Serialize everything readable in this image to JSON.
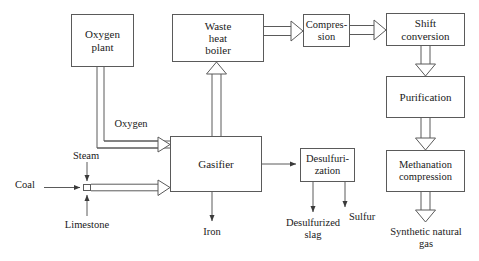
{
  "diagram": {
    "type": "process-flow-diagram",
    "colors": {
      "stroke": "#5a5a5a",
      "text": "#1a1a1a",
      "background": "#ffffff"
    },
    "nodes": [
      {
        "id": "oxygen-plant",
        "label": "Oxygen\nplant",
        "x": 71,
        "y": 14,
        "w": 63,
        "h": 53
      },
      {
        "id": "waste-heat-boiler",
        "label": "Waste\nheat\nboiler",
        "x": 172,
        "y": 14,
        "w": 92,
        "h": 48
      },
      {
        "id": "compression",
        "label": "Compres-\nsion",
        "x": 303,
        "y": 14,
        "w": 47,
        "h": 33
      },
      {
        "id": "shift-conversion",
        "label": "Shift\nconversion",
        "x": 386,
        "y": 13,
        "w": 79,
        "h": 33
      },
      {
        "id": "purification",
        "label": "Purification",
        "x": 386,
        "y": 76,
        "w": 79,
        "h": 42
      },
      {
        "id": "gasifier",
        "label": "Gasifier",
        "x": 170,
        "y": 136,
        "w": 92,
        "h": 56
      },
      {
        "id": "desulfurization",
        "label": "Desulfuri-\nzation",
        "x": 300,
        "y": 148,
        "w": 55,
        "h": 34
      },
      {
        "id": "methanation-compression",
        "label": "Methanation\ncompression",
        "x": 386,
        "y": 150,
        "w": 79,
        "h": 42
      },
      {
        "id": "mixer",
        "label": "",
        "x": 83,
        "y": 184,
        "w": 8,
        "h": 7
      }
    ],
    "stream_labels": [
      {
        "id": "oxygen",
        "text": "Oxygen",
        "x": 103,
        "y": 118,
        "w": 56
      },
      {
        "id": "steam",
        "text": "Steam",
        "x": 60,
        "y": 150,
        "w": 52
      },
      {
        "id": "coal",
        "text": "Coal",
        "x": 8,
        "y": 179,
        "w": 34
      },
      {
        "id": "limestone",
        "text": "Limestone",
        "x": 54,
        "y": 219,
        "w": 66
      },
      {
        "id": "iron",
        "text": "Iron",
        "x": 194,
        "y": 226,
        "w": 36
      },
      {
        "id": "desulfurized-slag",
        "text": "Desulfurized\nslag",
        "x": 272,
        "y": 217,
        "w": 82
      },
      {
        "id": "sulfur",
        "text": "Sulfur",
        "x": 349,
        "y": 211,
        "w": 44
      },
      {
        "id": "synthetic-natural-gas",
        "text": "Synthetic natural\ngas",
        "x": 372,
        "y": 226,
        "w": 108
      }
    ]
  }
}
